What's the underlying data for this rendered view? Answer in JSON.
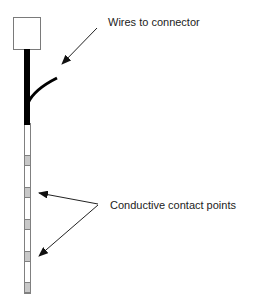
{
  "diagram": {
    "labels": {
      "wires": "Wires to connector",
      "contacts": "Conductive contact points"
    },
    "colors": {
      "box_stroke": "#7a7a7a",
      "cable": "#000000",
      "probe_stroke": "#808080",
      "contact_fill": "#c8c8c8",
      "arrow": "#222222",
      "text": "#222222"
    },
    "probe": {
      "contact_count": 5
    }
  }
}
